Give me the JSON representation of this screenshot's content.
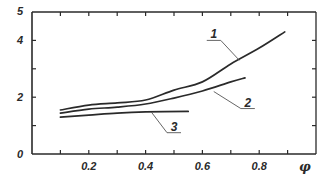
{
  "chart_data": {
    "type": "line",
    "title": "",
    "xlabel": "φ",
    "ylabel": "",
    "xlim": [
      0,
      1.0
    ],
    "ylim": [
      0,
      5
    ],
    "x_major_ticks": [
      0.1,
      0.2,
      0.3,
      0.4,
      0.5,
      0.6,
      0.7,
      0.8,
      0.9
    ],
    "x_tick_labels": [
      {
        "value": 0.2,
        "text": "0.2"
      },
      {
        "value": 0.4,
        "text": "0.4"
      },
      {
        "value": 0.6,
        "text": "0.6"
      },
      {
        "value": 0.8,
        "text": "0.8"
      }
    ],
    "y_major_ticks": [
      1,
      2,
      3,
      4
    ],
    "y_tick_labels": [
      {
        "value": 0,
        "text": "0"
      },
      {
        "value": 2,
        "text": "2"
      },
      {
        "value": 4,
        "text": "4"
      },
      {
        "value": 5,
        "text": "5"
      }
    ],
    "grid": false,
    "legend": "inline leader-line labels",
    "line_color": "#2a2a2a",
    "series": [
      {
        "name": "1",
        "x": [
          0.1,
          0.2,
          0.3,
          0.4,
          0.5,
          0.6,
          0.7,
          0.8,
          0.89
        ],
        "y": [
          1.55,
          1.72,
          1.8,
          1.9,
          2.25,
          2.54,
          3.17,
          3.73,
          4.3
        ],
        "label_anchor": {
          "x": 0.73,
          "y": 3.3
        },
        "label_pos": {
          "x": 0.64,
          "y": 4.0
        }
      },
      {
        "name": "2",
        "x": [
          0.1,
          0.2,
          0.3,
          0.4,
          0.5,
          0.6,
          0.7,
          0.75
        ],
        "y": [
          1.44,
          1.58,
          1.65,
          1.76,
          1.97,
          2.22,
          2.54,
          2.68
        ],
        "label_anchor": {
          "x": 0.64,
          "y": 2.2
        },
        "label_pos": {
          "x": 0.76,
          "y": 1.6
        }
      },
      {
        "name": "3",
        "x": [
          0.1,
          0.2,
          0.3,
          0.4,
          0.55
        ],
        "y": [
          1.3,
          1.37,
          1.44,
          1.48,
          1.5
        ],
        "label_anchor": {
          "x": 0.42,
          "y": 1.48
        },
        "label_pos": {
          "x": 0.5,
          "y": 0.75
        }
      }
    ]
  }
}
